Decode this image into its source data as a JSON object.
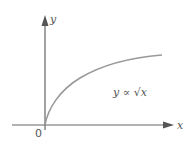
{
  "diagram": {
    "y_axis_label": "y",
    "x_axis_label": "x",
    "origin_label": "0",
    "curve_label": "y ∝ √x",
    "colors": {
      "axis": "#555555",
      "curve": "#999999",
      "text": "#555555"
    }
  }
}
